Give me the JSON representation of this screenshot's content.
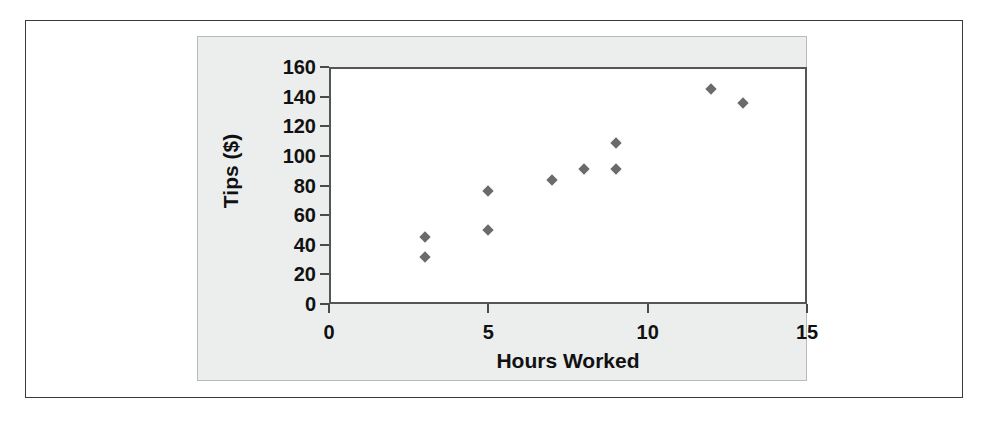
{
  "chart_data": {
    "type": "scatter",
    "title": "",
    "xlabel": "Hours Worked",
    "ylabel": "Tips ($)",
    "xlim": [
      0,
      15
    ],
    "ylim": [
      0,
      160
    ],
    "grid": false,
    "legend": null,
    "marker": "diamond",
    "marker_color": "#6b6b6b",
    "xticks": [
      "0",
      "5",
      "10",
      "15"
    ],
    "xtick_values": [
      0,
      5,
      10,
      15
    ],
    "yticks": [
      "0",
      "20",
      "40",
      "60",
      "80",
      "100",
      "120",
      "140",
      "160"
    ],
    "ytick_values": [
      0,
      20,
      40,
      60,
      80,
      100,
      120,
      140,
      160
    ],
    "points": [
      {
        "x": 3,
        "y": 45
      },
      {
        "x": 3,
        "y": 32
      },
      {
        "x": 5,
        "y": 76
      },
      {
        "x": 5,
        "y": 50
      },
      {
        "x": 7,
        "y": 84
      },
      {
        "x": 8,
        "y": 91
      },
      {
        "x": 9,
        "y": 109
      },
      {
        "x": 9,
        "y": 91
      },
      {
        "x": 12,
        "y": 145
      },
      {
        "x": 13,
        "y": 136
      }
    ]
  },
  "colors": {
    "figure_background": "#ffffff",
    "panel_background": "#eceded",
    "plot_background": "#ffffff",
    "axis": "#4a4a4a",
    "frame": "#3a3a3a",
    "text": "#111111",
    "marker": "#6b6b6b"
  }
}
